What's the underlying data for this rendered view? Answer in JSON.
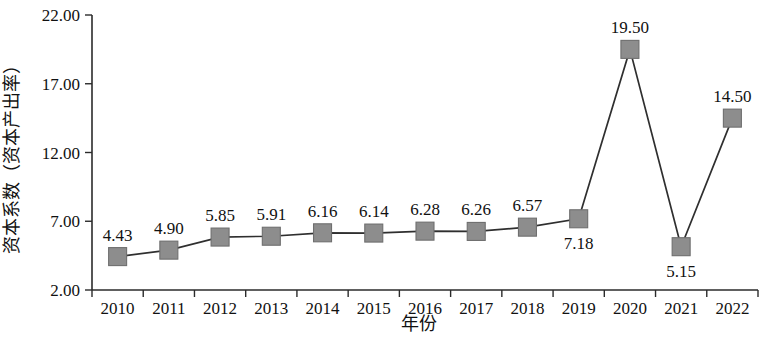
{
  "chart_data": {
    "type": "line",
    "title": "",
    "xlabel": "年份",
    "ylabel": "资本系数（资本产出率）",
    "categories": [
      "2010",
      "2011",
      "2012",
      "2013",
      "2014",
      "2015",
      "2016",
      "2017",
      "2018",
      "2019",
      "2020",
      "2021",
      "2022"
    ],
    "values": [
      4.43,
      4.9,
      5.85,
      5.91,
      6.16,
      6.14,
      6.28,
      6.26,
      6.57,
      7.18,
      19.5,
      5.15,
      14.5
    ],
    "point_labels": [
      "4.43",
      "4.90",
      "5.85",
      "5.91",
      "6.16",
      "6.14",
      "6.28",
      "6.26",
      "6.57",
      "7.18",
      "19.50",
      "5.15",
      "14.50"
    ],
    "label_positions": [
      "above",
      "above",
      "above",
      "above",
      "above",
      "above",
      "above",
      "above",
      "above",
      "below",
      "above",
      "below",
      "above"
    ],
    "ylim": [
      2.0,
      22.0
    ],
    "y_ticks": [
      2.0,
      7.0,
      12.0,
      17.0,
      22.0
    ],
    "y_tick_labels": [
      "2.00",
      "7.00",
      "12.00",
      "17.00",
      "22.00"
    ],
    "grid": false,
    "legend": "none",
    "marker": "square",
    "marker_color": "#8d8d8d",
    "line_color": "#2f2f2f",
    "axis_color": "#2b2b2b",
    "background_color": "#ffffff"
  }
}
